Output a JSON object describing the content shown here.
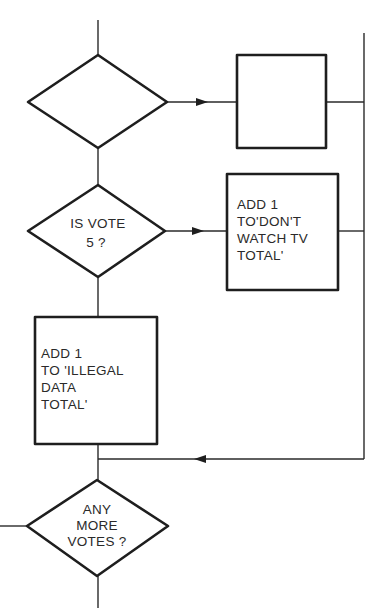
{
  "diagram": {
    "type": "flowchart",
    "colors": {
      "stroke": "#1e1e1e",
      "text": "#2a2a2a",
      "background": "#ffffff"
    },
    "nodes": [
      {
        "id": "decision-1",
        "shape": "diamond",
        "lines": []
      },
      {
        "id": "process-1",
        "shape": "rectangle",
        "lines": []
      },
      {
        "id": "decision-2",
        "shape": "diamond",
        "lines": [
          "IS VOTE",
          "5 ?"
        ]
      },
      {
        "id": "process-2",
        "shape": "rectangle",
        "lines": [
          "ADD 1",
          "TO'DON'T",
          "WATCH TV",
          "TOTAL'"
        ]
      },
      {
        "id": "process-3",
        "shape": "rectangle",
        "lines": [
          "ADD 1",
          "TO 'ILLEGAL",
          "DATA",
          "TOTAL'"
        ]
      },
      {
        "id": "decision-3",
        "shape": "diamond",
        "lines": [
          "ANY",
          "MORE",
          "VOTES ?"
        ]
      }
    ],
    "edges": [
      {
        "from": "decision-1",
        "to": "process-1",
        "arrow": true
      },
      {
        "from": "decision-1",
        "to": "decision-2",
        "arrow": false
      },
      {
        "from": "decision-2",
        "to": "process-2",
        "arrow": true
      },
      {
        "from": "decision-2",
        "to": "process-3",
        "arrow": false
      },
      {
        "from": "process-1",
        "to": "right-bus",
        "arrow": false
      },
      {
        "from": "process-2",
        "to": "right-bus",
        "arrow": false
      },
      {
        "from": "right-bus",
        "to": "decision-3",
        "arrow": true
      },
      {
        "from": "process-3",
        "to": "decision-3",
        "arrow": false
      }
    ]
  }
}
